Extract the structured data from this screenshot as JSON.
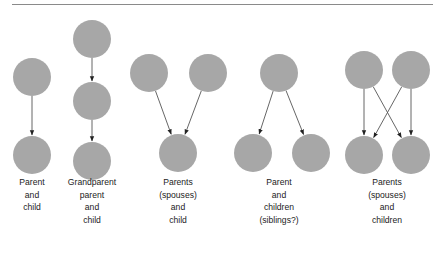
{
  "figure": {
    "node_color": "#a7a7a7",
    "edge_color": "#555555",
    "panels": [
      {
        "id": "parent-child",
        "label_lines": [
          "Parent",
          "and",
          "child"
        ],
        "nodes": [
          [
            32,
            77
          ],
          [
            32,
            155
          ]
        ],
        "edges": [
          [
            0,
            1
          ]
        ]
      },
      {
        "id": "grandparent-parent-child",
        "label_lines": [
          "Grandparent",
          "parent",
          "and",
          "child"
        ],
        "nodes": [
          [
            92,
            39
          ],
          [
            92,
            101
          ],
          [
            92,
            161
          ]
        ],
        "edges": [
          [
            0,
            1
          ],
          [
            1,
            2
          ]
        ]
      },
      {
        "id": "parents-spouses-child",
        "label_lines": [
          "Parents",
          "(spouses)",
          "and",
          "child"
        ],
        "nodes": [
          [
            149,
            73
          ],
          [
            208,
            73
          ],
          [
            178,
            153
          ]
        ],
        "edges": [
          [
            0,
            2
          ],
          [
            1,
            2
          ]
        ]
      },
      {
        "id": "parent-children-siblings",
        "label_lines": [
          "Parent",
          "and",
          "children",
          "(siblings?)"
        ],
        "nodes": [
          [
            279,
            73
          ],
          [
            253,
            153
          ],
          [
            311,
            153
          ]
        ],
        "edges": [
          [
            0,
            1
          ],
          [
            0,
            2
          ]
        ]
      },
      {
        "id": "parents-spouses-children",
        "label_lines": [
          "Parents",
          "(spouses)",
          "and",
          "children"
        ],
        "nodes": [
          [
            364,
            70
          ],
          [
            411,
            70
          ],
          [
            364,
            155
          ],
          [
            411,
            155
          ]
        ],
        "edges": [
          [
            0,
            2
          ],
          [
            0,
            3
          ],
          [
            1,
            2
          ],
          [
            1,
            3
          ]
        ]
      }
    ]
  }
}
